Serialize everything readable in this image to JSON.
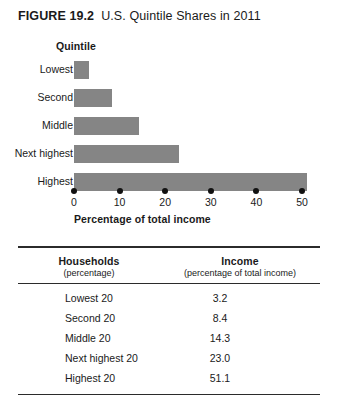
{
  "figure": {
    "number": "FIGURE 19.2",
    "title": "U.S. Quintile Shares in 2011"
  },
  "chart_data": {
    "type": "bar",
    "orientation": "horizontal",
    "title": "U.S. Quintile Shares in 2011",
    "category_axis_title": "Quintile",
    "xlabel": "Percentage of total income",
    "ylabel": "Quintile",
    "categories": [
      "Lowest",
      "Second",
      "Middle",
      "Next highest",
      "Highest"
    ],
    "values": [
      3.2,
      8.4,
      14.3,
      23.0,
      51.1
    ],
    "xticks": [
      0,
      10,
      20,
      30,
      40,
      50
    ],
    "xtick_labels": [
      "0",
      "10",
      "20",
      "30",
      "40",
      "50"
    ],
    "xlim": [
      0,
      52
    ],
    "grid": false,
    "legend": false,
    "bar_color": "#858585",
    "tick_marker": "filled-circle"
  },
  "table": {
    "columns": [
      {
        "main": "Households",
        "sub": "(percentage)"
      },
      {
        "main": "Income",
        "sub": "(percentage of total income)"
      }
    ],
    "rows": [
      {
        "label": "Lowest 20",
        "value": "3.2"
      },
      {
        "label": "Second 20",
        "value": "8.4"
      },
      {
        "label": "Middle 20",
        "value": "14.3"
      },
      {
        "label": "Next highest 20",
        "value": "23.0"
      },
      {
        "label": "Highest 20",
        "value": "51.1"
      }
    ]
  }
}
